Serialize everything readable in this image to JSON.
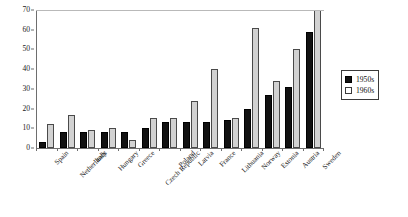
{
  "chart_data": {
    "type": "bar",
    "title": "",
    "xlabel": "",
    "ylabel": "",
    "ylim": [
      0,
      70
    ],
    "yticks": [
      0,
      10,
      20,
      30,
      40,
      50,
      60,
      70
    ],
    "grid": "top-line-only",
    "legend_position": "right",
    "categories": [
      "Spain",
      "Netherlands",
      "Italy",
      "Hungary",
      "Greece",
      "Czech Republic",
      "Poland",
      "Latvia",
      "France",
      "Lithuania",
      "Norway",
      "Estonia",
      "Austria",
      "Sweden"
    ],
    "series": [
      {
        "name": "1950s",
        "color": "#111111",
        "values": [
          3,
          8,
          8,
          8,
          8,
          10,
          13,
          13,
          13,
          14,
          20,
          27,
          31,
          59
        ]
      },
      {
        "name": "1960s",
        "color": "#d2d2d2",
        "values": [
          12,
          17,
          9,
          10,
          4,
          15,
          15,
          24,
          40,
          15,
          61,
          34,
          50,
          70
        ]
      }
    ]
  },
  "legend": {
    "items": [
      {
        "label": "1950s"
      },
      {
        "label": "1960s"
      }
    ]
  }
}
